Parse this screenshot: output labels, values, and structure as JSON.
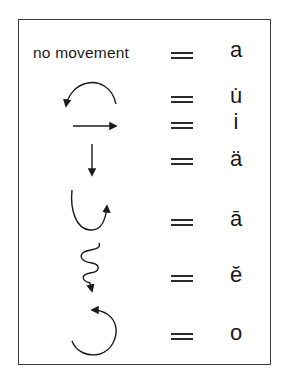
{
  "diagram": {
    "rows": [
      {
        "movement": "no movement",
        "movement_icon": "none",
        "equals": "=",
        "vowel": "a"
      },
      {
        "movement": "",
        "movement_icon": "arc-counterclockwise-left-arrow-icon",
        "equals": "=",
        "vowel": "u̇"
      },
      {
        "movement": "",
        "movement_icon": "arrow-right-icon",
        "equals": "=",
        "vowel": "i"
      },
      {
        "movement": "",
        "movement_icon": "arrow-down-icon",
        "equals": "=",
        "vowel": "ä"
      },
      {
        "movement": "",
        "movement_icon": "hook-up-right-arrow-icon",
        "equals": "=",
        "vowel": "ā"
      },
      {
        "movement": "",
        "movement_icon": "squiggle-down-arrow-icon",
        "equals": "=",
        "vowel": "ĕ"
      },
      {
        "movement": "",
        "movement_icon": "circle-counterclockwise-arrow-icon",
        "equals": "=",
        "vowel": "o"
      }
    ]
  },
  "colors": {
    "ink": "#1a1a1a",
    "border": "#3a3a3a",
    "background": "#ffffff"
  }
}
